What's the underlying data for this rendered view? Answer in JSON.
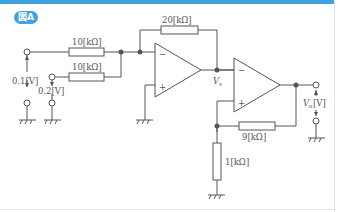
{
  "figure": {
    "badge": "図A",
    "labels": {
      "r_in1": "10[kΩ]",
      "r_in2": "10[kΩ]",
      "r_feedback": "20[kΩ]",
      "r_9k": "9[kΩ]",
      "r_1k": "1[kΩ]",
      "v_in1": "0.1[V]",
      "v_in2": "0.2[V]",
      "v_mid": "V",
      "v_mid_sub": "s",
      "v_out": "V",
      "v_out_sub": "o",
      "v_out_unit": "[V]",
      "minus": "−",
      "plus": "+"
    },
    "colors": {
      "accent": "#3fa3e0",
      "wire": "#555555"
    }
  }
}
